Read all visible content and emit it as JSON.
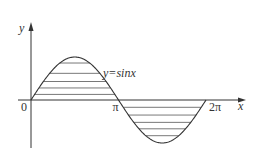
{
  "chart_data": {
    "type": "line",
    "title": "",
    "function": "sin(x)",
    "series": [
      {
        "name": "y=sinx",
        "x_start": 0,
        "x_end": 6.2832,
        "sample_points": [
          {
            "x": 0,
            "y": 0
          },
          {
            "x": 1.5708,
            "y": 1
          },
          {
            "x": 3.1416,
            "y": 0
          },
          {
            "x": 4.7124,
            "y": -1
          },
          {
            "x": 6.2832,
            "y": 0
          }
        ]
      }
    ],
    "shaded_regions": [
      {
        "from": 0,
        "to": 3.1416,
        "side": "above-axis",
        "style": "horizontal-hatch",
        "hatch_levels": [
          0.13,
          0.28,
          0.43,
          0.62,
          0.86
        ]
      },
      {
        "from": 3.1416,
        "to": 6.2832,
        "side": "below-axis",
        "style": "horizontal-hatch",
        "hatch_levels": [
          -0.17,
          -0.35,
          -0.52,
          -0.67,
          -0.83
        ]
      }
    ],
    "xlabel": "x",
    "ylabel": "y",
    "x_ticks": [
      {
        "value": 0,
        "label": "0"
      },
      {
        "value": 3.1416,
        "label": "π"
      },
      {
        "value": 6.2832,
        "label": "2π"
      }
    ],
    "curve_label": "y=sinx",
    "xlim": [
      0,
      7.4
    ],
    "ylim": [
      -1.4,
      1.8
    ],
    "grid": false,
    "legend": "none"
  }
}
